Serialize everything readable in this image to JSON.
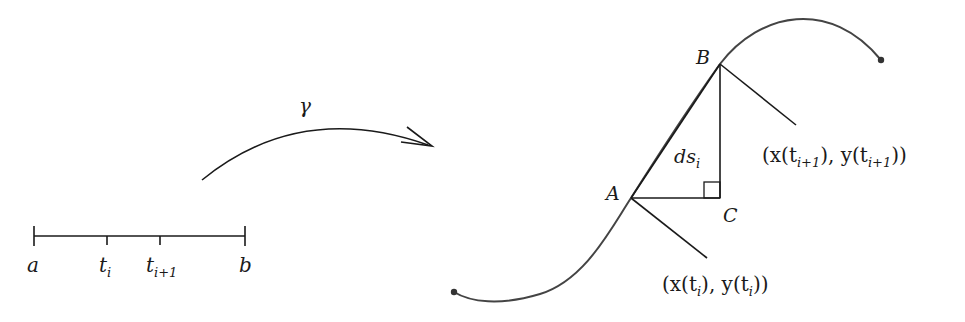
{
  "figure": {
    "colors": {
      "ink": "#1a1a1a",
      "curve": "#444444",
      "background": "#ffffff"
    }
  },
  "interval": {
    "left_label": "a",
    "right_label": "b",
    "ticks": [
      {
        "base": "t",
        "sub": "i"
      },
      {
        "base": "t",
        "sub": "i+1"
      }
    ]
  },
  "mapping": {
    "label": "γ"
  },
  "curve": {
    "points": {
      "A": "A",
      "B": "B",
      "C": "C"
    },
    "segment_label": {
      "base": "ds",
      "sub": "i"
    },
    "annotations": {
      "point_i": {
        "open": "(x(t",
        "sub": "i",
        "mid": "), y(t",
        "sub2": "i",
        "close": "))"
      },
      "point_i1": {
        "open": "(x(t",
        "sub": "i+1",
        "mid": "), y(t",
        "sub2": "i+1",
        "close": "))"
      }
    }
  }
}
